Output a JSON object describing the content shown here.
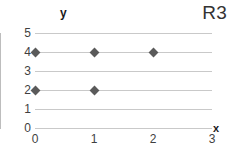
{
  "chart_data": {
    "type": "scatter",
    "title": "",
    "corner_label": "R3",
    "xlabel": "x",
    "ylabel": "y",
    "xlim": [
      0,
      3
    ],
    "ylim": [
      0,
      5
    ],
    "xticks": [
      "0",
      "1",
      "2",
      "3"
    ],
    "yticks": [
      "0",
      "1",
      "2",
      "3",
      "4",
      "5"
    ],
    "xtick_values": [
      0,
      1,
      2,
      3
    ],
    "ytick_values": [
      0,
      1,
      2,
      3,
      4,
      5
    ],
    "grid": true,
    "grid_orientation": "horizontal",
    "legend": "none",
    "marker_shape": "diamond",
    "marker_color": "#5a5a5a",
    "gridline_color": "#c9c9c9",
    "axis_color": "#bdbdbd",
    "points": [
      {
        "x": 0,
        "y": 4
      },
      {
        "x": 1,
        "y": 4
      },
      {
        "x": 2,
        "y": 4
      },
      {
        "x": 0,
        "y": 2
      },
      {
        "x": 1,
        "y": 2
      }
    ]
  }
}
